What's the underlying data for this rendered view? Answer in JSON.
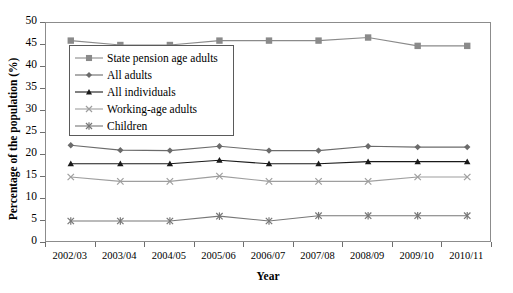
{
  "chart_data": {
    "type": "line",
    "title": "",
    "xlabel": "Year",
    "ylabel": "Percentage of the population (%)",
    "categories": [
      "2002/03",
      "2003/04",
      "2004/05",
      "2005/06",
      "2006/07",
      "2007/08",
      "2008/09",
      "2009/10",
      "2010/11"
    ],
    "ylim": [
      0,
      50
    ],
    "yticks": [
      0,
      5,
      10,
      15,
      20,
      25,
      30,
      35,
      40,
      45,
      50
    ],
    "grid": false,
    "legend_position": "upper-left-inside",
    "series": [
      {
        "name": "State pension age adults",
        "marker": "square",
        "color": "#8a8a8a",
        "values": [
          46.0,
          45.0,
          45.0,
          46.0,
          46.0,
          46.0,
          46.7,
          44.8,
          44.8
        ]
      },
      {
        "name": "All adults",
        "marker": "diamond",
        "color": "#6b6b6b",
        "values": [
          22.2,
          21.1,
          21.0,
          22.0,
          21.0,
          21.0,
          22.0,
          21.8,
          21.8
        ]
      },
      {
        "name": "All individuals",
        "marker": "triangle",
        "color": "#1a1a1a",
        "values": [
          18.0,
          18.0,
          18.0,
          18.8,
          18.0,
          18.0,
          18.5,
          18.5,
          18.5
        ]
      },
      {
        "name": "Working-age adults",
        "marker": "x",
        "color": "#9e9e9e",
        "values": [
          15.0,
          14.0,
          14.0,
          15.2,
          14.0,
          14.0,
          14.0,
          15.0,
          15.0
        ]
      },
      {
        "name": "Children",
        "marker": "asterisk",
        "color": "#777777",
        "values": [
          5.0,
          5.0,
          5.0,
          6.1,
          5.0,
          6.2,
          6.2,
          6.2,
          6.2
        ]
      }
    ]
  },
  "axis": {
    "ylabel": "Percentage of the population (%)",
    "xlabel": "Year"
  },
  "colors": {
    "frame": "#8c8c8c",
    "tick": "#6e6e6e",
    "legend_border": "#5a5a5a",
    "background": "#ffffff"
  }
}
